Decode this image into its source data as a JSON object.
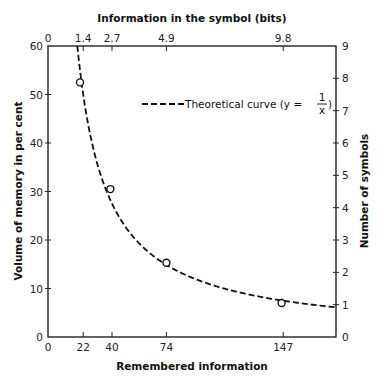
{
  "chart_data": {
    "type": "line",
    "title": "",
    "xlabel": "Remembered information",
    "ylabel": "Volume of memory in per cent",
    "x2label": "Information in the symbol (bits)",
    "y2label": "Number of symbols",
    "xlim": [
      0,
      180
    ],
    "ylim": [
      0,
      60
    ],
    "y2lim": [
      0,
      9
    ],
    "grid": false,
    "x_ticks": [
      {
        "value": 0,
        "label": "0"
      },
      {
        "value": 22,
        "label": "22"
      },
      {
        "value": 40,
        "label": "40"
      },
      {
        "value": 74,
        "label": "74"
      },
      {
        "value": 147,
        "label": "147"
      }
    ],
    "x2_ticks": [
      {
        "value": 0,
        "label": "0"
      },
      {
        "value": 22,
        "label": "1.4"
      },
      {
        "value": 40,
        "label": "2.7"
      },
      {
        "value": 74,
        "label": "4.9"
      },
      {
        "value": 147,
        "label": "9.8"
      }
    ],
    "y_ticks": [
      {
        "value": 0,
        "label": "0"
      },
      {
        "value": 10,
        "label": "10"
      },
      {
        "value": 20,
        "label": "20"
      },
      {
        "value": 30,
        "label": "30"
      },
      {
        "value": 40,
        "label": "40"
      },
      {
        "value": 50,
        "label": "50"
      },
      {
        "value": 60,
        "label": "60"
      }
    ],
    "y2_ticks": [
      {
        "value": 0,
        "label": "0"
      },
      {
        "value": 1,
        "label": "1"
      },
      {
        "value": 2,
        "label": "2"
      },
      {
        "value": 3,
        "label": "3"
      },
      {
        "value": 4,
        "label": "4"
      },
      {
        "value": 5,
        "label": "5"
      },
      {
        "value": 6,
        "label": "6"
      },
      {
        "value": 7,
        "label": "7"
      },
      {
        "value": 8,
        "label": "8"
      },
      {
        "value": 9,
        "label": "9"
      }
    ],
    "series": [
      {
        "name": "Observed",
        "style": "open-circle",
        "points": [
          {
            "x": 20,
            "y": 52.5
          },
          {
            "x": 39,
            "y": 30.5
          },
          {
            "x": 74,
            "y": 15.3
          },
          {
            "x": 146,
            "y": 7
          }
        ]
      },
      {
        "name": "Theoretical curve",
        "style": "dashed-line",
        "equation": "y = k/x",
        "k": 1100,
        "x_range": [
          18.3,
          180
        ]
      }
    ],
    "legend": {
      "position": "top-right",
      "label_prefix": "Theoretical curve (y =",
      "fraction_num": "1",
      "fraction_den": "x",
      "label_suffix": ")"
    }
  }
}
